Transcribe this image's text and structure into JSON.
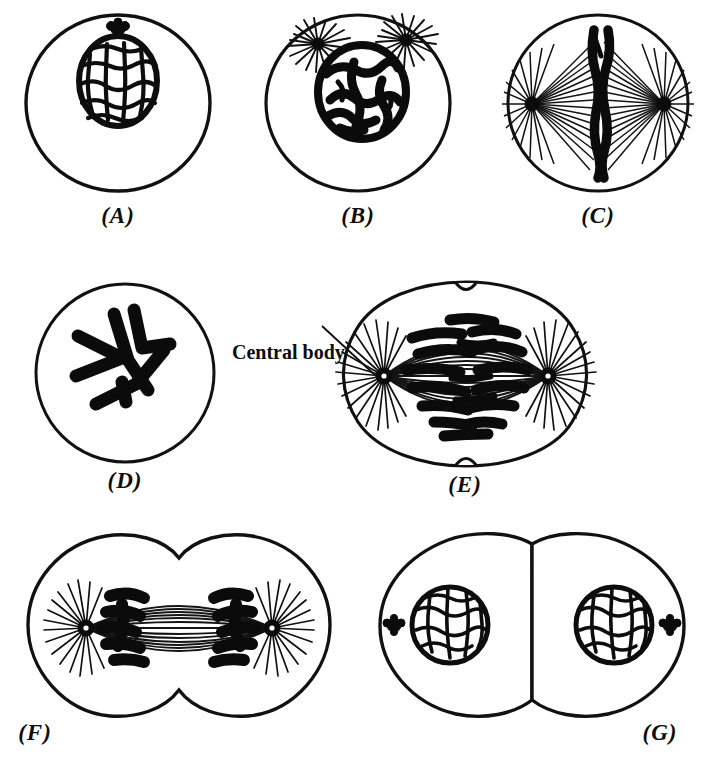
{
  "figure": {
    "background_color": "#ffffff",
    "ink_color": "#111111",
    "panel_count": 7
  },
  "annotations": [
    {
      "id": "central-body",
      "text": "Central body",
      "points_to": "panel-e-left-aster",
      "x": 232,
      "y": 341
    }
  ],
  "panels": [
    {
      "id": "A",
      "label": "(A)",
      "stage": "resting-cell",
      "x": 18,
      "y": 8,
      "width": 200,
      "height": 195,
      "label_y": 203,
      "cell_shape": "single-oval",
      "features": [
        "cell-membrane",
        "reticular-nucleus",
        "centrosome-above-nucleus"
      ],
      "nucleus": {
        "cx": 100,
        "cy": 72,
        "rx": 38,
        "ry": 45,
        "pattern": "reticular-network"
      },
      "centrosome": {
        "cx": 100,
        "cy": 20,
        "r": 8
      },
      "aster_count": 0,
      "chromosome_count": 0
    },
    {
      "id": "B",
      "label": "(B)",
      "stage": "early-prophase",
      "x": 258,
      "y": 8,
      "width": 200,
      "height": 195,
      "label_y": 203,
      "cell_shape": "single-oval",
      "features": [
        "cell-membrane",
        "spireme-nucleus",
        "two-asters"
      ],
      "nucleus": {
        "cx": 104,
        "cy": 82,
        "rx": 42,
        "ry": 45,
        "pattern": "thick-spireme-threads"
      },
      "asters": [
        {
          "cx": 60,
          "cy": 36,
          "r": 7,
          "rays": 18
        },
        {
          "cx": 148,
          "cy": 32,
          "r": 7,
          "rays": 18
        }
      ],
      "aster_count": 2,
      "chromosome_count": 0
    },
    {
      "id": "C",
      "label": "(C)",
      "stage": "metaphase-equatorial-plate",
      "x": 498,
      "y": 8,
      "width": 200,
      "height": 195,
      "label_y": 203,
      "cell_shape": "single-oval",
      "features": [
        "cell-membrane",
        "spindle",
        "equatorial-chromosome-plate",
        "two-asters"
      ],
      "asters": [
        {
          "cx": 32,
          "cy": 96,
          "r": 8,
          "rays": 30
        },
        {
          "cx": 168,
          "cy": 96,
          "r": 8,
          "rays": 30
        }
      ],
      "spindle": {
        "cx": 100,
        "cy": 96,
        "fiber_count": 34
      },
      "aster_count": 2,
      "chromosome_count": 2
    },
    {
      "id": "D",
      "label": "(D)",
      "stage": "polar-view-v-shaped-chromosomes",
      "x": 30,
      "y": 278,
      "width": 190,
      "height": 190,
      "label_y": 470,
      "cell_shape": "single-circle",
      "features": [
        "cell-membrane",
        "v-shaped-chromosomes"
      ],
      "aster_count": 0,
      "chromosome_count": 4
    },
    {
      "id": "E",
      "label": "(E)",
      "stage": "anaphase",
      "x": 300,
      "y": 276,
      "width": 330,
      "height": 196,
      "label_y": 472,
      "cell_shape": "dividing-shallow-furrow",
      "features": [
        "cell-membrane",
        "cleavage-furrow",
        "barrel-spindle",
        "separating-chromosomes",
        "two-asters",
        "central-body-label"
      ],
      "asters": [
        {
          "cx": 80,
          "cy": 100,
          "r": 9,
          "rays": 34
        },
        {
          "cx": 250,
          "cy": 100,
          "r": 9,
          "rays": 34
        }
      ],
      "aster_count": 2,
      "chromosome_count": 16
    },
    {
      "id": "F",
      "label": "(F)",
      "stage": "telophase",
      "x": 14,
      "y": 530,
      "width": 330,
      "height": 190,
      "label_y": 718,
      "cell_shape": "dividing-deep-furrow",
      "features": [
        "cell-membrane",
        "deep-cleavage-furrow",
        "interzonal-fibers",
        "polar-chromosome-groups",
        "two-asters"
      ],
      "asters": [
        {
          "cx": 72,
          "cy": 98,
          "r": 9,
          "rays": 30
        },
        {
          "cx": 258,
          "cy": 98,
          "r": 9,
          "rays": 30
        }
      ],
      "aster_count": 2,
      "chromosome_count": 12
    },
    {
      "id": "G",
      "label": "(G)",
      "stage": "two-daughter-cells",
      "x": 372,
      "y": 530,
      "width": 320,
      "height": 190,
      "label_y": 718,
      "cell_shape": "two-daughter-circles",
      "features": [
        "two-cell-membranes",
        "two-reticular-nuclei",
        "two-centrosomes"
      ],
      "nuclei": [
        {
          "cx": 78,
          "cy": 95,
          "r": 38,
          "pattern": "reticular-network"
        },
        {
          "cx": 242,
          "cy": 95,
          "r": 38,
          "pattern": "reticular-network"
        }
      ],
      "centrosomes": [
        {
          "cx": 22,
          "cy": 95,
          "r": 8
        },
        {
          "cx": 298,
          "cy": 95,
          "r": 8
        }
      ],
      "aster_count": 0,
      "chromosome_count": 0
    }
  ]
}
